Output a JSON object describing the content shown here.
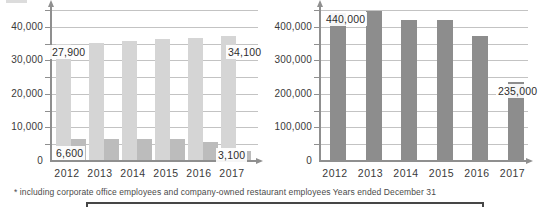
{
  "footnote": {
    "text": "* including corporate office employees and company-owned restaurant employees Years ended December 31"
  },
  "colors": {
    "background": "#ffffff",
    "grid": "#c3c3c3",
    "axis": "#8f8f8f",
    "bar_light_gray": "#d5d5d5",
    "bar_medium_gray": "#bcbcbc",
    "bar_dark_gray": "#8d8d8d",
    "label_text": "#2d2d2d"
  },
  "chart_data": [
    {
      "type": "bar",
      "title": "",
      "categories": [
        "2012",
        "2013",
        "2014",
        "2015",
        "2016",
        "2017"
      ],
      "series": [
        {
          "color": "#d5d5d5",
          "values": [
            34900,
            35300,
            35900,
            36300,
            36600,
            37300
          ]
        },
        {
          "color": "#bcbcbc",
          "values": [
            6600,
            6500,
            6500,
            6500,
            5700,
            3100
          ]
        }
      ],
      "data_labels": [
        {
          "text": "27,900",
          "series": 0,
          "category": "2012"
        },
        {
          "text": "34,100",
          "series": 0,
          "category": "2017"
        },
        {
          "text": "6,600",
          "series": 1,
          "category": "2012"
        },
        {
          "text": "3,100",
          "series": 1,
          "category": "2017"
        }
      ],
      "ylim": [
        0,
        45000
      ],
      "minor_step": 5000,
      "grid": true,
      "legend": "none",
      "yticks": [
        {
          "label": "40,000",
          "value": 40000
        },
        {
          "label": "30,000",
          "value": 30000
        },
        {
          "label": "20,000",
          "value": 20000
        },
        {
          "label": "10,000",
          "value": 10000
        },
        {
          "label": "0",
          "value": 0
        }
      ]
    },
    {
      "type": "bar",
      "title": "",
      "categories": [
        "2012",
        "2013",
        "2014",
        "2015",
        "2016",
        "2017"
      ],
      "series": [
        {
          "color": "#8d8d8d",
          "values": [
            440000,
            448000,
            420000,
            420000,
            373000,
            235000
          ]
        }
      ],
      "data_labels": [
        {
          "text": "440,000",
          "series": 0,
          "category": "2012"
        },
        {
          "text": "235,000",
          "series": 0,
          "category": "2017"
        }
      ],
      "ylim": [
        0,
        450000
      ],
      "minor_step": 50000,
      "grid": true,
      "legend": "none",
      "yticks": [
        {
          "label": "400,000",
          "value": 400000
        },
        {
          "label": "300,000",
          "value": 300000
        },
        {
          "label": "200,000",
          "value": 200000
        },
        {
          "label": "100,000",
          "value": 100000
        },
        {
          "label": "0",
          "value": 0
        }
      ]
    }
  ]
}
